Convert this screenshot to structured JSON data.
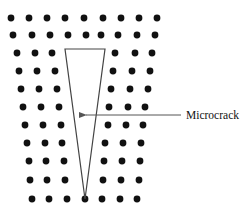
{
  "diagram": {
    "type": "atomic lattice with wedge-shaped microcrack",
    "annotation": {
      "label": "Microcrack",
      "arrow_from": [
        181,
        115
      ],
      "arrow_to": [
        79,
        115
      ]
    },
    "crack": {
      "shape": "triangle",
      "top_left": [
        65,
        49
      ],
      "top_right": [
        105,
        49
      ],
      "apex": [
        85,
        199
      ]
    },
    "colors": {
      "atom": "#111111",
      "crack_outline": "#444444",
      "arrow": "#555555",
      "text": "#111111",
      "background": "#ffffff"
    },
    "atom_radius": 3.4,
    "rows": [
      {
        "y": 18,
        "x": [
          11,
          29,
          47,
          65,
          84,
          103,
          121,
          139,
          157
        ]
      },
      {
        "y": 35,
        "x": [
          13,
          32,
          50,
          68,
          86,
          101,
          118,
          137,
          155
        ]
      },
      {
        "y": 53,
        "x": [
          17,
          35,
          52,
          115,
          135,
          152
        ]
      },
      {
        "y": 71,
        "x": [
          19,
          37,
          55,
          113,
          132,
          150
        ]
      },
      {
        "y": 89,
        "x": [
          21,
          39,
          57,
          111,
          130,
          148
        ]
      },
      {
        "y": 107,
        "x": [
          23,
          41,
          59,
          109,
          128,
          145
        ]
      },
      {
        "y": 125,
        "x": [
          25,
          43,
          61,
          108,
          126,
          143
        ]
      },
      {
        "y": 143,
        "x": [
          27,
          45,
          62,
          105,
          123,
          141
        ]
      },
      {
        "y": 161,
        "x": [
          29,
          46,
          64,
          104,
          122,
          140
        ]
      },
      {
        "y": 180,
        "x": [
          30,
          47,
          65,
          103,
          121,
          139
        ]
      },
      {
        "y": 199,
        "x": [
          32,
          49,
          67,
          85,
          102,
          120,
          137
        ]
      }
    ]
  }
}
